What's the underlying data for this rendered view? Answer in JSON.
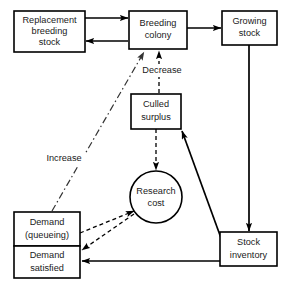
{
  "diagram": {
    "background_color": "#ffffff",
    "line_color": "#000000",
    "nodes": [
      {
        "id": "replacement-breeding-stock",
        "shape": "rect",
        "lines": [
          "Replacement",
          "breeding",
          "stock"
        ],
        "line1": "Replacement",
        "line2": "breeding",
        "line3": "stock",
        "x": 14,
        "y": 11,
        "w": 71,
        "h": 41
      },
      {
        "id": "breeding-colony",
        "shape": "rect",
        "lines": [
          "Breeding",
          "colony"
        ],
        "line1": "Breeding",
        "line2": "colony",
        "x": 129,
        "y": 11,
        "w": 58,
        "h": 38
      },
      {
        "id": "growing-stock",
        "shape": "rect",
        "lines": [
          "Growing",
          "stock"
        ],
        "line1": "Growing",
        "line2": "stock",
        "x": 222,
        "y": 11,
        "w": 55,
        "h": 34
      },
      {
        "id": "culled-surplus",
        "shape": "rect",
        "lines": [
          "Culled",
          "surplus"
        ],
        "line1": "Culled",
        "line2": "surplus",
        "x": 131,
        "y": 94,
        "w": 50,
        "h": 35
      },
      {
        "id": "research-cost",
        "shape": "circle",
        "lines": [
          "Research",
          "cost"
        ],
        "line1": "Research",
        "line2": "cost",
        "cx": 156,
        "cy": 197,
        "r": 26
      },
      {
        "id": "demand-queueing",
        "shape": "rect",
        "lines": [
          "Demand",
          "(queueing)"
        ],
        "line1": "Demand",
        "line2": "(queueing)",
        "x": 14,
        "y": 212,
        "w": 66,
        "h": 34
      },
      {
        "id": "demand-satisfied",
        "shape": "rect",
        "lines": [
          "Demand",
          "satisfied"
        ],
        "line1": "Demand",
        "line2": "satisfied",
        "x": 14,
        "y": 246,
        "w": 66,
        "h": 32
      },
      {
        "id": "stock-inventory",
        "shape": "rect",
        "lines": [
          "Stock",
          "inventory"
        ],
        "line1": "Stock",
        "line2": "inventory",
        "x": 220,
        "y": 232,
        "w": 57,
        "h": 34
      }
    ],
    "edges": [
      {
        "id": "replacement-to-breeding",
        "from": "replacement-breeding-stock",
        "to": "breeding-colony",
        "style": "solid",
        "label": ""
      },
      {
        "id": "breeding-to-replacement",
        "from": "breeding-colony",
        "to": "replacement-breeding-stock",
        "style": "solid",
        "label": ""
      },
      {
        "id": "breeding-to-growing",
        "from": "breeding-colony",
        "to": "growing-stock",
        "style": "solid",
        "label": ""
      },
      {
        "id": "growing-to-stock-inventory",
        "from": "growing-stock",
        "to": "stock-inventory",
        "style": "solid",
        "label": ""
      },
      {
        "id": "culled-to-breeding",
        "from": "culled-surplus",
        "to": "breeding-colony",
        "style": "dashed",
        "label": "Decrease"
      },
      {
        "id": "culled-to-research",
        "from": "culled-surplus",
        "to": "research-cost",
        "style": "dashed",
        "label": ""
      },
      {
        "id": "stock-inventory-to-culled",
        "from": "stock-inventory",
        "to": "culled-surplus",
        "style": "solid",
        "label": ""
      },
      {
        "id": "stock-inventory-to-demand-satisfied",
        "from": "stock-inventory",
        "to": "demand-satisfied",
        "style": "solid",
        "label": ""
      },
      {
        "id": "demand-queueing-to-research",
        "from": "demand-queueing",
        "to": "research-cost",
        "style": "dashed",
        "label": ""
      },
      {
        "id": "research-to-demand-satisfied",
        "from": "research-cost",
        "to": "demand-satisfied",
        "style": "dashed",
        "label": ""
      },
      {
        "id": "demand-queueing-to-breeding",
        "from": "demand-queueing",
        "to": "breeding-colony",
        "style": "dashdot",
        "label": "Increase"
      }
    ],
    "labels": {
      "decrease": "Decrease",
      "increase": "Increase"
    }
  }
}
